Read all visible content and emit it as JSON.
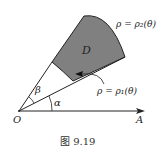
{
  "figure": {
    "caption": "图 9.19",
    "labels": {
      "origin": "O",
      "axis_end": "A",
      "region": "D",
      "alpha": "α",
      "beta": "β",
      "outer_curve": "ρ = ρ₂(θ)",
      "inner_curve": "ρ = ρ₁(θ)"
    },
    "colors": {
      "region_fill": "#808080",
      "stroke": "#222222"
    }
  }
}
